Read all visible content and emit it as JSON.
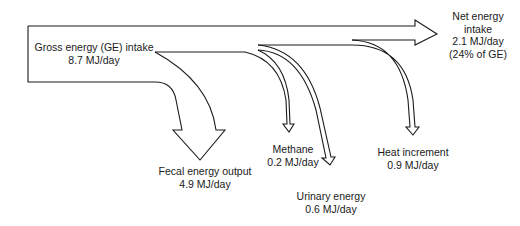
{
  "diagram": {
    "type": "energy-flow",
    "source": {
      "name": "Gross energy (GE) intake",
      "value": "8.7 MJ/day"
    },
    "outputs": [
      {
        "id": "fecal",
        "name": "Fecal energy output",
        "value": "4.9 MJ/day"
      },
      {
        "id": "methane",
        "name": "Methane",
        "value": "0.2 MJ/day"
      },
      {
        "id": "urinary",
        "name": "Urinary energy",
        "value": "0.6 MJ/day"
      },
      {
        "id": "heat",
        "name": "Heat increment",
        "value": "0.9 MJ/day"
      }
    ],
    "result": {
      "name_line1": "Net energy",
      "name_line2": "intake",
      "value": "2.1 MJ/day",
      "share": "(24% of GE)"
    }
  }
}
